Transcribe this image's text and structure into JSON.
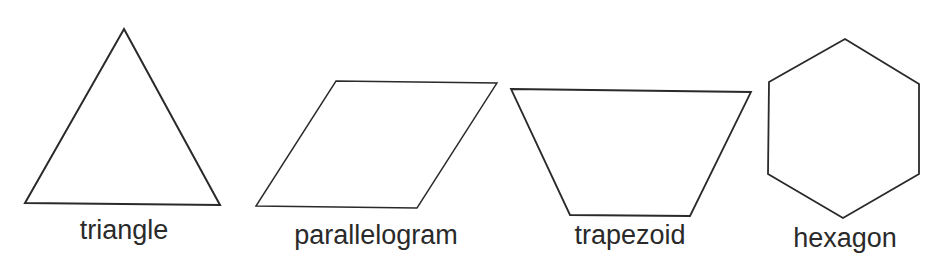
{
  "shapes": [
    {
      "name": "triangle",
      "label": "triangle",
      "points": "124,29 220,205 25,203",
      "label_x": 124,
      "label_y": 217
    },
    {
      "name": "parallelogram",
      "label": "parallelogram",
      "points": "256,206 336,81 497,83 417,208",
      "label_x": 376,
      "label_y": 222
    },
    {
      "name": "trapezoid",
      "label": "trapezoid",
      "points": "511,89 751,92 690,216 570,215",
      "label_x": 630,
      "label_y": 222
    },
    {
      "name": "hexagon",
      "label": "hexagon",
      "points": "845,39 919,84 919,174 843,218 768,174 769,82",
      "label_x": 845,
      "label_y": 225
    }
  ],
  "stroke_color": "#2a2a2a"
}
